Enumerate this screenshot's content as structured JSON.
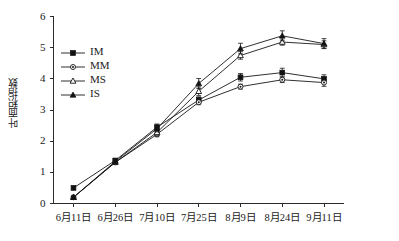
{
  "chart_data": {
    "type": "line",
    "title": "",
    "xlabel": "",
    "ylabel": "叶面积指数",
    "ylim": [
      0,
      6
    ],
    "yticks": [
      0,
      1,
      2,
      3,
      4,
      5,
      6
    ],
    "grid": false,
    "legend_position": "upper-left-inside",
    "error_bars": true,
    "categories": [
      "6月11日",
      "6月26日",
      "7月10日",
      "7月25日",
      "8月9日",
      "8月24日",
      "9月11日"
    ],
    "series": [
      {
        "name": "IM",
        "marker": "filled-square",
        "values": [
          0.5,
          1.38,
          2.45,
          3.32,
          4.05,
          4.2,
          4.0
        ],
        "errors": [
          0.05,
          0.06,
          0.1,
          0.1,
          0.12,
          0.14,
          0.13
        ]
      },
      {
        "name": "MM",
        "marker": "open-circle",
        "values": [
          0.2,
          1.32,
          2.22,
          3.25,
          3.75,
          3.97,
          3.88
        ],
        "errors": [
          0.04,
          0.05,
          0.08,
          0.08,
          0.08,
          0.09,
          0.12
        ]
      },
      {
        "name": "MS",
        "marker": "open-triangle",
        "values": [
          0.2,
          1.32,
          2.28,
          3.6,
          4.75,
          5.18,
          5.1
        ],
        "errors": [
          0.04,
          0.05,
          0.09,
          0.14,
          0.12,
          0.1,
          0.12
        ]
      },
      {
        "name": "IS",
        "marker": "filled-triangle",
        "values": [
          0.2,
          1.35,
          2.4,
          3.85,
          4.97,
          5.38,
          5.13
        ],
        "errors": [
          0.04,
          0.06,
          0.1,
          0.16,
          0.17,
          0.16,
          0.16
        ]
      }
    ]
  },
  "legend": {
    "items": [
      {
        "label": "IM"
      },
      {
        "label": "MM"
      },
      {
        "label": "MS"
      },
      {
        "label": "IS"
      }
    ]
  },
  "axes": {
    "y_title": "叶面积指数",
    "y_tick_labels": [
      "0",
      "1",
      "2",
      "3",
      "4",
      "5",
      "6"
    ],
    "x_tick_labels": [
      "6月11日",
      "6月26日",
      "7月10日",
      "7月25日",
      "8月9日",
      "8月24日",
      "9月11日"
    ]
  },
  "colors": {
    "axis": "#2b2b2b",
    "series": "#181818",
    "background": "#ffffff"
  }
}
